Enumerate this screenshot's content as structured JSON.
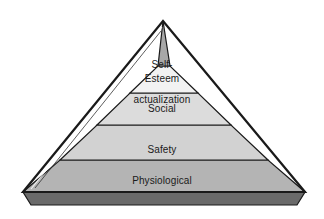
{
  "diagram": {
    "name": "maslow-hierarchy-of-needs-pyramid",
    "type": "pyramid",
    "background_color": "#ffffff",
    "outline_color": "#1a1a1a",
    "text_color": "#1a1a1a",
    "base_strip_color": "#6a6a6a",
    "tiers": [
      {
        "index": 1,
        "position": "top",
        "label": "Self-\nactualization",
        "line1": "Self-",
        "line2": "actualization",
        "fill_color": "#a8a8a8"
      },
      {
        "index": 2,
        "position": "second",
        "label": "Esteem",
        "fill_color": "#f2f2f2"
      },
      {
        "index": 3,
        "position": "middle",
        "label": "Social",
        "fill_color": "#dcdcdc"
      },
      {
        "index": 4,
        "position": "fourth",
        "label": "Safety",
        "fill_color": "#d2d2d2"
      },
      {
        "index": 5,
        "position": "bottom",
        "label": "Physiological",
        "fill_color": "#b4b4b4"
      }
    ]
  }
}
